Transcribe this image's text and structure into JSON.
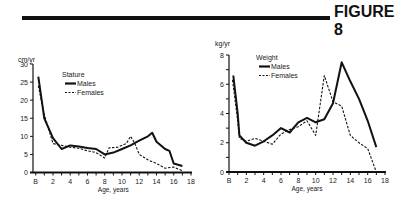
{
  "header": {
    "figure_label": "FIGURE 8"
  },
  "chart_data": [
    {
      "type": "line",
      "title": "Stature",
      "xlabel": "Age, years",
      "ylabel": "cm/yr",
      "xlim": [
        0,
        18
      ],
      "ylim": [
        0,
        30
      ],
      "x_ticks": [
        "B",
        "2",
        "4",
        "6",
        "8",
        "10",
        "12",
        "14",
        "16",
        "18"
      ],
      "y_ticks": [
        "0",
        "5",
        "10",
        "15",
        "20",
        "25",
        "30"
      ],
      "grid": false,
      "legend_position": "top-center",
      "series": [
        {
          "name": "Males",
          "style": "solid",
          "x": [
            0.3,
            1,
            2,
            3,
            4,
            5,
            6,
            7,
            8,
            9,
            10,
            11,
            12,
            13,
            13.5,
            14,
            15,
            15.5,
            16,
            17
          ],
          "values": [
            26.5,
            15,
            9.5,
            6.5,
            7.5,
            7.2,
            6.8,
            6.5,
            5,
            5.5,
            6.5,
            7.5,
            8.8,
            10,
            11,
            8.5,
            6.5,
            6,
            2.5,
            1.8
          ]
        },
        {
          "name": "Females",
          "style": "dashed",
          "x": [
            0.3,
            1,
            2,
            3,
            4,
            5,
            6,
            7,
            8,
            8.5,
            9.5,
            10.5,
            11,
            11.5,
            12,
            13,
            14,
            15,
            16,
            17
          ],
          "values": [
            24,
            16,
            8,
            7.5,
            7,
            6.7,
            6,
            5.5,
            4,
            6.8,
            7,
            8,
            10,
            8,
            5,
            3.5,
            2.5,
            1.2,
            1.5,
            0.5
          ]
        }
      ]
    },
    {
      "type": "line",
      "title": "Weight",
      "xlabel": "Age, years",
      "ylabel": "kg/yr",
      "xlim": [
        0,
        18
      ],
      "ylim": [
        0,
        8
      ],
      "x_ticks": [
        "B",
        "2",
        "4",
        "6",
        "8",
        "10",
        "12",
        "14",
        "16",
        "18"
      ],
      "y_ticks": [
        "0",
        "2",
        "4",
        "6",
        "8"
      ],
      "grid": false,
      "legend_position": "top-center",
      "series": [
        {
          "name": "Males",
          "style": "solid",
          "x": [
            0.5,
            1,
            1.2,
            2,
            3,
            4,
            5,
            6,
            7,
            8,
            9,
            10,
            11,
            12,
            13,
            14,
            15,
            16,
            17
          ],
          "values": [
            6.6,
            4,
            2.5,
            2,
            1.8,
            2.1,
            2.5,
            3,
            2.7,
            3.4,
            3.7,
            3.4,
            3.6,
            4.7,
            7.5,
            6.2,
            5,
            3.5,
            1.7
          ]
        },
        {
          "name": "Females",
          "style": "dashed",
          "x": [
            0.4,
            1,
            1.2,
            2,
            3,
            4,
            5,
            6,
            7,
            8,
            9,
            10,
            11,
            12,
            13,
            14,
            15,
            16,
            17
          ],
          "values": [
            6.3,
            3.5,
            2.3,
            2.1,
            2.3,
            2.1,
            1.9,
            2.6,
            2.9,
            3.1,
            3.5,
            2.5,
            6.6,
            4.8,
            4.5,
            2.5,
            2,
            1.6,
            0
          ]
        }
      ]
    }
  ]
}
